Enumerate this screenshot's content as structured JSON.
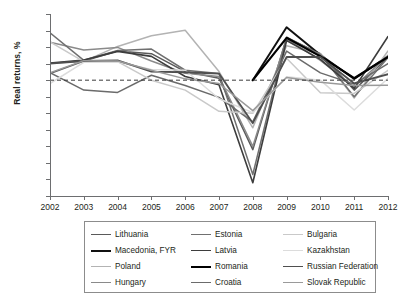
{
  "chart_data": {
    "type": "line",
    "title": "",
    "xlabel": "",
    "ylabel": "Real returns, %",
    "x": [
      2002,
      2003,
      2004,
      2005,
      2006,
      2007,
      2008,
      2009,
      2010,
      2011,
      2012
    ],
    "xlim": [
      2002,
      2012
    ],
    "ylim": [
      -35,
      20
    ],
    "yticks": [
      20,
      15,
      10,
      5,
      0,
      -5,
      -10,
      -15,
      -20,
      -25,
      -30,
      -35
    ],
    "xticks": [
      2002,
      2003,
      2004,
      2005,
      2006,
      2007,
      2008,
      2009,
      2010,
      2011,
      2012
    ],
    "grid": false,
    "zero_reference_line": {
      "value": 0,
      "style": "dashed"
    },
    "legend_position": "below",
    "legend_columns": 3,
    "series": [
      {
        "name": "Lithuania",
        "color": "#5a5a5a",
        "width": 1.5,
        "values": [
          2.0,
          5.8,
          8.8,
          8.0,
          2.6,
          0.6,
          -21.0,
          12.8,
          8.0,
          -3.0,
          7.0
        ]
      },
      {
        "name": "Macedonia, FYR",
        "color": "#111111",
        "width": 2.0,
        "values": [
          null,
          null,
          null,
          null,
          null,
          null,
          0.0,
          16.0,
          7.6,
          0.4,
          7.2
        ]
      },
      {
        "name": "Poland",
        "color": "#b3b3b3",
        "width": 1.5,
        "values": [
          5.1,
          5.7,
          10.2,
          13.4,
          15.1,
          2.6,
          -14.4,
          10.4,
          8.0,
          -5.4,
          8.8
        ]
      },
      {
        "name": "Hungary",
        "color": "#8a8a8a",
        "width": 1.5,
        "values": [
          11.5,
          9.1,
          9.9,
          5.8,
          2.1,
          1.1,
          -20.0,
          12.5,
          6.0,
          -2.0,
          7.5
        ]
      },
      {
        "name": "Estonia",
        "color": "#707070",
        "width": 1.5,
        "values": [
          14.3,
          6.0,
          9.0,
          9.4,
          3.0,
          2.0,
          -28.5,
          13.0,
          7.8,
          -5.0,
          6.8
        ]
      },
      {
        "name": "Latvia",
        "color": "#3d3d3d",
        "width": 1.6,
        "values": [
          5.2,
          6.1,
          8.7,
          7.2,
          1.1,
          -1.4,
          -31.0,
          12.0,
          6.3,
          -2.5,
          13.2
        ]
      },
      {
        "name": "Romania",
        "color": "#000000",
        "width": 2.2,
        "values": [
          null,
          null,
          null,
          null,
          null,
          null,
          0.0,
          12.8,
          7.2,
          0.6,
          7.0
        ]
      },
      {
        "name": "Croatia",
        "color": "#6b6b6b",
        "width": 1.5,
        "values": [
          2.3,
          -3.0,
          -3.7,
          1.5,
          -1.6,
          -5.2,
          -12.6,
          8.8,
          2.2,
          -1.2,
          5.0
        ]
      },
      {
        "name": "Bulgaria",
        "color": "#c9c9c9",
        "width": 1.5,
        "values": [
          11.6,
          5.6,
          5.6,
          0.0,
          -3.0,
          -9.4,
          -10.0,
          6.6,
          -3.8,
          -4.0,
          3.0
        ]
      },
      {
        "name": "Kazakhstan",
        "color": "#dcdcdc",
        "width": 1.5,
        "values": [
          -1.0,
          5.4,
          5.5,
          3.2,
          3.0,
          -5.6,
          -9.8,
          1.0,
          0.0,
          -9.0,
          0.6
        ]
      },
      {
        "name": "Russian Federation",
        "color": "#4f4f4f",
        "width": 1.8,
        "values": [
          5.0,
          5.8,
          6.0,
          2.6,
          2.4,
          2.0,
          -13.0,
          7.0,
          7.0,
          -1.0,
          1.8
        ]
      },
      {
        "name": "Slovak Republic",
        "color": "#9a9a9a",
        "width": 1.5,
        "values": [
          2.2,
          5.9,
          5.8,
          3.0,
          0.4,
          -1.0,
          -9.2,
          0.8,
          -0.6,
          -1.6,
          -1.5
        ]
      }
    ]
  },
  "axes": {
    "y_title": "Real returns, %",
    "y_tick_labels": [
      "20",
      "15",
      "10",
      "5",
      "0",
      "–5",
      "–10",
      "–15",
      "–20",
      "–25",
      "–30",
      "–35"
    ],
    "x_tick_labels": [
      "2002",
      "2003",
      "2004",
      "2005",
      "2006",
      "2007",
      "2008",
      "2009",
      "2010",
      "2011",
      "2012"
    ]
  },
  "legend": {
    "entries": [
      {
        "label": "Lithuania",
        "color": "#5a5a5a",
        "width": 1.5
      },
      {
        "label": "Estonia",
        "color": "#707070",
        "width": 1.5
      },
      {
        "label": "Bulgaria",
        "color": "#c9c9c9",
        "width": 1.5
      },
      {
        "label": "Macedonia, FYR",
        "color": "#111111",
        "width": 2.2
      },
      {
        "label": "Latvia",
        "color": "#3d3d3d",
        "width": 1.8
      },
      {
        "label": "Kazakhstan",
        "color": "#dcdcdc",
        "width": 1.5
      },
      {
        "label": "Poland",
        "color": "#b3b3b3",
        "width": 1.5
      },
      {
        "label": "Romania",
        "color": "#000000",
        "width": 2.4
      },
      {
        "label": "Russian Federation",
        "color": "#4f4f4f",
        "width": 1.8
      },
      {
        "label": "Hungary",
        "color": "#8a8a8a",
        "width": 1.5
      },
      {
        "label": "Croatia",
        "color": "#6b6b6b",
        "width": 1.5
      },
      {
        "label": "Slovak Republic",
        "color": "#9a9a9a",
        "width": 1.5
      }
    ]
  },
  "colors": {
    "axis": "#6d6e70",
    "text": "#231f20",
    "zero_line": "#3a3a3a",
    "legend_border": "#8c8c8c",
    "background": "#ffffff"
  }
}
